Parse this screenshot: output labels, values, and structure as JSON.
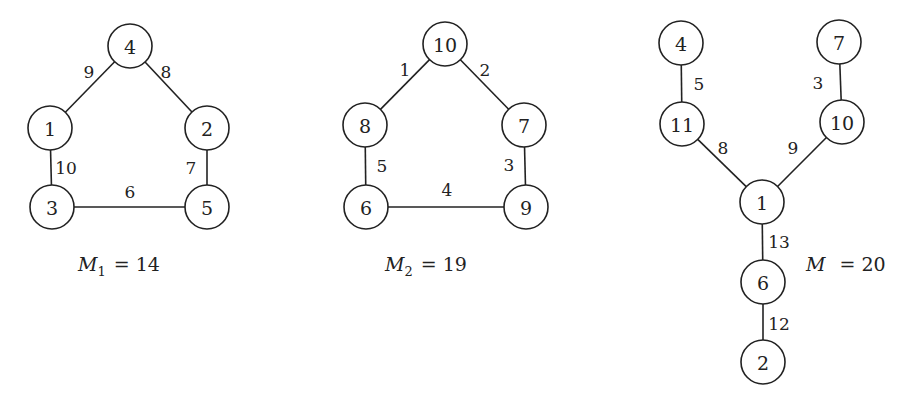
{
  "graphs": [
    {
      "id": "g1",
      "caption": {
        "symbol": "M",
        "subscript": "1",
        "equals": "=",
        "value": "14",
        "x": 78,
        "y": 271
      },
      "nodes": [
        {
          "label": "4",
          "x": 130,
          "y": 46
        },
        {
          "label": "1",
          "x": 50,
          "y": 128
        },
        {
          "label": "2",
          "x": 207,
          "y": 128
        },
        {
          "label": "3",
          "x": 52,
          "y": 207
        },
        {
          "label": "5",
          "x": 207,
          "y": 207
        }
      ],
      "edges": [
        {
          "from": 0,
          "to": 1,
          "weight": "9",
          "lx": 89,
          "ly": 72
        },
        {
          "from": 0,
          "to": 2,
          "weight": "8",
          "lx": 166,
          "ly": 72
        },
        {
          "from": 1,
          "to": 3,
          "weight": "10",
          "lx": 66,
          "ly": 168
        },
        {
          "from": 2,
          "to": 4,
          "weight": "7",
          "lx": 191,
          "ly": 168
        },
        {
          "from": 3,
          "to": 4,
          "weight": "6",
          "lx": 130,
          "ly": 192
        }
      ]
    },
    {
      "id": "g2",
      "caption": {
        "symbol": "M",
        "subscript": "2",
        "equals": "=",
        "value": "19",
        "x": 385,
        "y": 271
      },
      "nodes": [
        {
          "label": "10",
          "x": 445,
          "y": 44
        },
        {
          "label": "8",
          "x": 365,
          "y": 125
        },
        {
          "label": "7",
          "x": 524,
          "y": 125
        },
        {
          "label": "6",
          "x": 366,
          "y": 207
        },
        {
          "label": "9",
          "x": 526,
          "y": 207
        }
      ],
      "edges": [
        {
          "from": 0,
          "to": 1,
          "weight": "1",
          "lx": 405,
          "ly": 70
        },
        {
          "from": 0,
          "to": 2,
          "weight": "2",
          "lx": 485,
          "ly": 70
        },
        {
          "from": 1,
          "to": 3,
          "weight": "5",
          "lx": 382,
          "ly": 166
        },
        {
          "from": 2,
          "to": 4,
          "weight": "3",
          "lx": 509,
          "ly": 165
        },
        {
          "from": 3,
          "to": 4,
          "weight": "4",
          "lx": 447,
          "ly": 190
        }
      ]
    },
    {
      "id": "g3",
      "caption": {
        "symbol": "M",
        "subscript": "",
        "equals": "=",
        "value": "20",
        "x": 806,
        "y": 271
      },
      "nodes": [
        {
          "label": "4",
          "x": 681,
          "y": 43
        },
        {
          "label": "7",
          "x": 839,
          "y": 42
        },
        {
          "label": "11",
          "x": 682,
          "y": 124
        },
        {
          "label": "10",
          "x": 842,
          "y": 122
        },
        {
          "label": "1",
          "x": 762,
          "y": 202
        },
        {
          "label": "6",
          "x": 763,
          "y": 282
        },
        {
          "label": "2",
          "x": 763,
          "y": 362
        }
      ],
      "edges": [
        {
          "from": 0,
          "to": 2,
          "weight": "5",
          "lx": 699,
          "ly": 84
        },
        {
          "from": 1,
          "to": 3,
          "weight": "3",
          "lx": 818,
          "ly": 83
        },
        {
          "from": 2,
          "to": 4,
          "weight": "8",
          "lx": 723,
          "ly": 148
        },
        {
          "from": 3,
          "to": 4,
          "weight": "9",
          "lx": 793,
          "ly": 148
        },
        {
          "from": 4,
          "to": 5,
          "weight": "13",
          "lx": 779,
          "ly": 242
        },
        {
          "from": 5,
          "to": 6,
          "weight": "12",
          "lx": 779,
          "ly": 324
        }
      ]
    }
  ],
  "node_radius": 22
}
